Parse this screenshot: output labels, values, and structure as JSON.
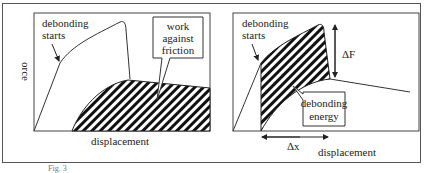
{
  "left_plot": {
    "y_axis_label": "orce",
    "x_axis_label": "displacement",
    "annotation_start": [
      "debonding",
      "starts"
    ],
    "callout": [
      "work",
      "against",
      "friction"
    ]
  },
  "right_plot": {
    "x_axis_label": "displacement",
    "annotation_start": [
      "debonding",
      "starts"
    ],
    "delta_f_label": "ΔF",
    "delta_x_label": "Δx",
    "callout": [
      "debonding",
      "energy"
    ]
  },
  "caption": "Fig. 3"
}
